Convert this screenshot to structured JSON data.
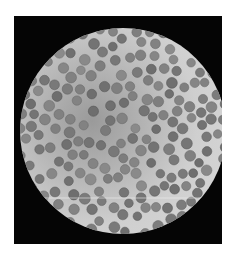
{
  "image": {
    "subject": "microscope-blood-smear",
    "description": "Grayscale light micrograph of red blood cells in a circular field of view",
    "colors": {
      "background": "#ffffff",
      "frame": "#050505",
      "field_light": "#d8d8d8",
      "field_dark": "#9a9a9a",
      "cell": "#7e7e7e"
    }
  }
}
